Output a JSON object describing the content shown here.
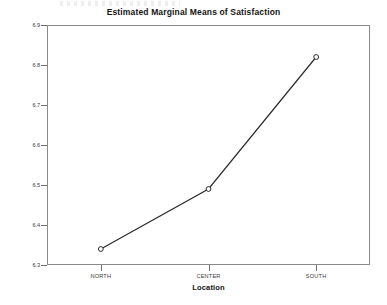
{
  "chart_data": {
    "type": "line",
    "title": "Estimated Marginal Means of Satisfaction",
    "xlabel": "Location",
    "ylabel": "Estimated Marginal Means",
    "categories": [
      "NORTH",
      "CENTER",
      "SOUTH"
    ],
    "values": [
      6.34,
      6.49,
      6.82
    ],
    "series": [
      {
        "name": "Estimated Marginal Means",
        "values": [
          6.34,
          6.49,
          6.82
        ]
      }
    ],
    "ylim": [
      6.3,
      6.9
    ],
    "yticks": [
      6.9,
      6.8,
      6.7,
      6.6,
      6.5,
      6.4,
      6.3
    ],
    "ytick_labels": [
      "6.9",
      "6.8",
      "6.7",
      "6.6",
      "6.5",
      "6.4",
      "6.3"
    ],
    "grid": false,
    "legend": "none",
    "marker": "open-circle",
    "line_color": "#2b2b2b",
    "marker_color": "#2b2b2b",
    "frame_color": "#8a8a8a"
  }
}
